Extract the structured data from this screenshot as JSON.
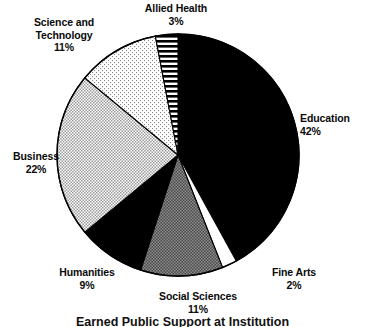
{
  "chart_data": {
    "type": "pie",
    "title": "Earned Public Support at Institution",
    "title_truncated": true,
    "categories": [
      "Education",
      "Fine Arts",
      "Social Sciences",
      "Humanities",
      "Business",
      "Science and Technology",
      "Allied Health"
    ],
    "values": [
      42,
      2,
      11,
      9,
      22,
      11,
      3
    ],
    "value_suffix": "%",
    "units": "percent",
    "start_angle_deg": 0,
    "direction": "clockwise",
    "legend": "none",
    "labels_position": "outside-callout",
    "slices": [
      {
        "name": "Education",
        "value": 42,
        "value_label": "42%",
        "fill": "solid-black",
        "color": "#000000"
      },
      {
        "name": "Fine Arts",
        "value": 2,
        "value_label": "2%",
        "fill": "solid-white",
        "color": "#ffffff"
      },
      {
        "name": "Social Sciences",
        "value": 11,
        "value_label": "11%",
        "fill": "dense-gray-dither",
        "color": "#6e6e6e"
      },
      {
        "name": "Humanities",
        "value": 9,
        "value_label": "9%",
        "fill": "solid-black",
        "color": "#000000"
      },
      {
        "name": "Business",
        "value": 22,
        "value_label": "22%",
        "fill": "checker-gray-dither",
        "color": "#b9b9b9"
      },
      {
        "name": "Science and Technology",
        "value": 11,
        "value_label": "11%",
        "fill": "fine-dots",
        "color": "#f2f2f2"
      },
      {
        "name": "Allied Health",
        "value": 3,
        "value_label": "3%",
        "fill": "horizontal-stripes",
        "color": "#ffffff"
      }
    ],
    "stroke_color": "#000000",
    "background": "#ffffff"
  },
  "labels": {
    "education": {
      "name": "Education",
      "value": "42%"
    },
    "fine_arts": {
      "name": "Fine Arts",
      "value": "2%"
    },
    "social_sciences": {
      "name": "Social Sciences",
      "value": "11%"
    },
    "humanities": {
      "name": "Humanities",
      "value": "9%"
    },
    "business": {
      "name": "Business",
      "value": "22%"
    },
    "science_tech_l1": "Science and",
    "science_tech_l2": "Technology",
    "science_tech_value": "11%",
    "allied_health": {
      "name": "Allied Health",
      "value": "3%"
    }
  },
  "title": "Earned Public Support at Institution"
}
